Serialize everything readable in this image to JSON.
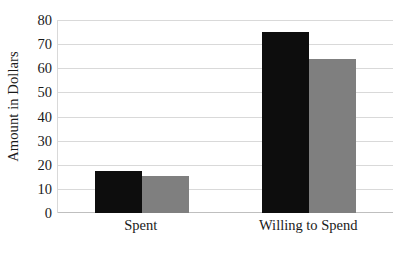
{
  "chart_data": {
    "type": "bar",
    "title": "",
    "subtitle": "",
    "xlabel": "",
    "ylabel": "Amount in Dollars",
    "categories": [
      "Spent",
      "Willing to Spend"
    ],
    "series": [
      {
        "name": "series-1",
        "color": "#0d0d0d",
        "values": [
          17.4,
          75.0
        ]
      },
      {
        "name": "series-2",
        "color": "#7f7f7f",
        "values": [
          15.3,
          64.0
        ]
      }
    ],
    "ylim": [
      0,
      80
    ],
    "ytick_labels": [
      "0",
      "10",
      "20",
      "30",
      "40",
      "50",
      "60",
      "70",
      "80"
    ],
    "ytick_values": [
      0,
      10,
      20,
      30,
      40,
      50,
      60,
      70,
      80
    ],
    "grid": true,
    "grid_color": "#d9d9d9",
    "legend": false,
    "legend_position": "none",
    "annotations": [],
    "background_color": "#ffffff",
    "axis_color": "#bfbfbf",
    "text_color": "#1a1a1a"
  }
}
